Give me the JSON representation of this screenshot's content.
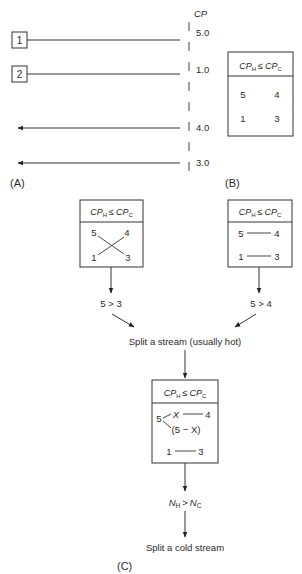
{
  "panel_a": {
    "label": "(A)",
    "axis_label": "CP",
    "streams": [
      {
        "id": "1",
        "type": "hot",
        "cp": "5.0"
      },
      {
        "id": "2",
        "type": "hot",
        "cp": "1.0"
      },
      {
        "id": "3",
        "type": "cold",
        "cp": "4.0"
      },
      {
        "id": "4",
        "type": "cold",
        "cp": "3.0"
      }
    ]
  },
  "panel_b": {
    "label": "(B)",
    "header": {
      "left": "CP",
      "left_sub": "H",
      "op": "≤",
      "right": "CP",
      "right_sub": "C"
    },
    "rows": [
      {
        "hot": "5",
        "cold": "4"
      },
      {
        "hot": "1",
        "cold": "3"
      }
    ]
  },
  "panel_c": {
    "label": "(C)",
    "left_box": {
      "header": {
        "left": "CP",
        "left_sub": "H",
        "op": "≤",
        "right": "CP",
        "right_sub": "C"
      },
      "hot": [
        "5",
        "1"
      ],
      "cold": [
        "4",
        "3"
      ],
      "matching": "crossed"
    },
    "right_box": {
      "header": {
        "left": "CP",
        "left_sub": "H",
        "op": "≤",
        "right": "CP",
        "right_sub": "C"
      },
      "rows": [
        {
          "hot": "5",
          "cold": "4"
        },
        {
          "hot": "1",
          "cold": "3"
        }
      ],
      "matching": "straight"
    },
    "left_condition": "5 > 3",
    "right_condition": "5 > 4",
    "merge_step": "Split a stream (usually hot)",
    "center_box": {
      "header": {
        "left": "CP",
        "left_sub": "H",
        "op": "≤",
        "right": "CP",
        "right_sub": "C"
      },
      "split_source": "5",
      "split_branch": "X",
      "split_remainder": "(5 − X)",
      "split_match": "4",
      "row2": {
        "hot": "1",
        "cold": "3"
      }
    },
    "final_condition": {
      "left": "N",
      "left_sub": "H",
      "op": ">",
      "right": "N",
      "right_sub": "C"
    },
    "final_step": "Split a cold stream"
  }
}
